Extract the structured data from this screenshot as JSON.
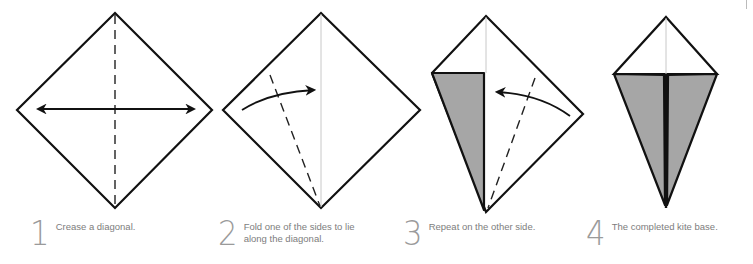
{
  "colors": {
    "outline": "#111111",
    "flap_fill": "#a6a6a6",
    "crease_line": "#c8c8c8",
    "step_number": "#9a9a9a",
    "caption_text": "#7d7d7d"
  },
  "steps": [
    {
      "number": "1",
      "caption": "Crease a diagonal."
    },
    {
      "number": "2",
      "caption": "Fold one of the sides to lie\nalong the diagonal."
    },
    {
      "number": "3",
      "caption": "Repeat on the other side."
    },
    {
      "number": "4",
      "caption": "The completed kite base."
    }
  ],
  "icons": {
    "step1": [
      "square-diamond-icon",
      "dashed-crease-icon",
      "double-headed-arrow-icon"
    ],
    "step2": [
      "square-diamond-icon",
      "dashed-fold-line-icon",
      "curved-arrow-right-icon"
    ],
    "step3": [
      "half-kite-icon",
      "folded-flap-icon",
      "dashed-fold-line-icon",
      "curved-arrow-left-icon"
    ],
    "step4": [
      "kite-base-icon"
    ]
  }
}
